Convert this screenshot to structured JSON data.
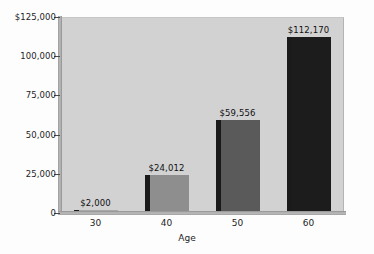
{
  "chart_data": {
    "type": "bar",
    "title": "",
    "subtitle": "",
    "xlabel": "Age",
    "ylabel": "",
    "categories": [
      "30",
      "40",
      "50",
      "60"
    ],
    "values": [
      2000,
      24012,
      59556,
      112170
    ],
    "value_labels": [
      "$2,000",
      "$24,012",
      "$59,556",
      "$112,170"
    ],
    "bar_colors": [
      "#a8a8a8",
      "#8e8e8e",
      "#5a5a5a",
      "#1c1c1c"
    ],
    "bar_shadow_color": "#1a1a1a",
    "ylim": [
      0,
      125000
    ],
    "y_ticks": [
      0,
      25000,
      50000,
      75000,
      100000,
      125000
    ],
    "y_tick_labels": [
      "0",
      "25,000",
      "50,000",
      "75,000",
      "100,000",
      "$125,000"
    ],
    "grid": false,
    "legend": "none",
    "plot_background": "#d2d2d2",
    "page_background": "#fdfdfd"
  },
  "axes": {
    "x_axis_title": "Age",
    "x_tick_labels": [
      "30",
      "40",
      "50",
      "60"
    ],
    "y_tick_labels": [
      "$125,000",
      "100,000",
      "75,000",
      "50,000",
      "25,000",
      "0"
    ]
  }
}
